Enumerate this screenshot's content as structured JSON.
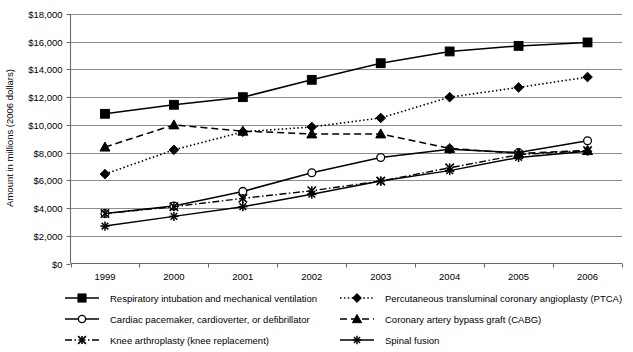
{
  "chart_data": {
    "type": "line",
    "title": "",
    "xlabel": "",
    "ylabel": "Amount in millions (2006 dollars)",
    "x": [
      "1999",
      "2000",
      "2001",
      "2002",
      "2003",
      "2004",
      "2005",
      "2006"
    ],
    "categories": [
      "1999",
      "2000",
      "2001",
      "2002",
      "2003",
      "2004",
      "2005",
      "2006"
    ],
    "ylim": [
      0,
      18000
    ],
    "ytick_values": [
      0,
      2000,
      4000,
      6000,
      8000,
      10000,
      12000,
      14000,
      16000,
      18000
    ],
    "ytick_labels": [
      "$0",
      "$2,000",
      "$4,000",
      "$6,000",
      "$8,000",
      "$10,000",
      "$12,000",
      "$14,000",
      "$16,000",
      "$18,000"
    ],
    "grid": true,
    "legend_position": "bottom",
    "series": [
      {
        "name": "Respiratory intubation and mechanical ventilation",
        "marker": "filled-square",
        "dash": "solid",
        "values": [
          10800,
          11450,
          12000,
          13250,
          14450,
          15300,
          15700,
          15950
        ]
      },
      {
        "name": "Percutaneous transluminal coronary angioplasty (PTCA)",
        "marker": "filled-diamond",
        "dash": "dotted",
        "values": [
          6450,
          8200,
          9500,
          9850,
          10500,
          12000,
          12700,
          13450
        ]
      },
      {
        "name": "Cardiac pacemaker, cardioverter, or defibrillator",
        "marker": "open-circle",
        "dash": "solid",
        "values": [
          3600,
          4150,
          5200,
          6550,
          7650,
          8250,
          8000,
          8850
        ]
      },
      {
        "name": "Coronary artery bypass graft (CABG)",
        "marker": "filled-triangle",
        "dash": "dashed",
        "values": [
          8400,
          10000,
          9550,
          9350,
          9350,
          8300,
          7950,
          8150
        ]
      },
      {
        "name": "Knee arthroplasty (knee replacement)",
        "marker": "x-cross",
        "dash": "dash-dot",
        "values": [
          3600,
          4100,
          4700,
          5250,
          5950,
          6900,
          7850,
          8150
        ]
      },
      {
        "name": "Spinal fusion",
        "marker": "star-asterisk",
        "dash": "solid",
        "values": [
          2700,
          3400,
          4100,
          5000,
          5950,
          6700,
          7650,
          8100
        ]
      }
    ]
  },
  "legend": {
    "entries": [
      {
        "label": "Respiratory intubation and mechanical ventilation"
      },
      {
        "label": "Percutaneous transluminal coronary angioplasty (PTCA)"
      },
      {
        "label": "Cardiac pacemaker, cardioverter, or defibrillator"
      },
      {
        "label": "Coronary artery bypass graft (CABG)"
      },
      {
        "label": "Knee arthroplasty (knee replacement)"
      },
      {
        "label": "Spinal fusion"
      }
    ]
  },
  "colors": {
    "series": "#000000",
    "gridline": "#8c8c8c",
    "axis": "#6b6b6b",
    "background": "#ffffff"
  }
}
